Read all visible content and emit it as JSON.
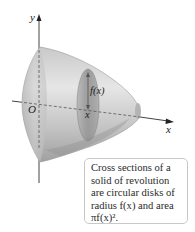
{
  "figure": {
    "axes": {
      "x_label": "x",
      "y_label": "y",
      "origin_label": "O"
    },
    "cross_section": {
      "radius_label": "f(x)",
      "position_label": "x"
    },
    "caption": {
      "lines": [
        "Cross sections of a",
        "solid of revolution",
        "are circular disks of",
        "radius f(x) and area",
        "πf(x)²."
      ]
    },
    "colors": {
      "solid_light": "#e4e4e4",
      "solid_mid": "#bdbdbd",
      "solid_dark": "#8f8f8f",
      "disk": "#9e9e9e",
      "axis": "#333333",
      "box_border": "#c9c9c9"
    }
  }
}
